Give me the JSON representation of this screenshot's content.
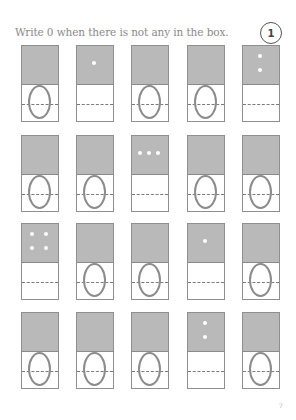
{
  "instruction": "Write 0 when there is not any in the box.",
  "exercise_number": "1",
  "page_number": "7",
  "colors": {
    "card_top": "#b9b9b9",
    "card_border": "#8f8f8f",
    "oval": "#8c8c8c",
    "dot": "#ffffff",
    "text": "#8a8a8a"
  },
  "layout": {
    "columns_x": [
      21,
      76,
      131,
      187,
      242
    ],
    "rows_y": [
      45,
      135,
      223,
      312
    ]
  },
  "cards": [
    [
      {
        "dots": 0,
        "answer": "0"
      },
      {
        "dots": 1,
        "answer": ""
      },
      {
        "dots": 0,
        "answer": "0"
      },
      {
        "dots": 0,
        "answer": "0"
      },
      {
        "dots": 2,
        "answer": ""
      }
    ],
    [
      {
        "dots": 0,
        "answer": "0"
      },
      {
        "dots": 0,
        "answer": "0"
      },
      {
        "dots": 3,
        "answer": ""
      },
      {
        "dots": 0,
        "answer": "0"
      },
      {
        "dots": 0,
        "answer": "0"
      }
    ],
    [
      {
        "dots": 4,
        "answer": ""
      },
      {
        "dots": 0,
        "answer": "0"
      },
      {
        "dots": 0,
        "answer": "0"
      },
      {
        "dots": 1,
        "answer": ""
      },
      {
        "dots": 0,
        "answer": "0"
      }
    ],
    [
      {
        "dots": 0,
        "answer": "0"
      },
      {
        "dots": 0,
        "answer": "0"
      },
      {
        "dots": 0,
        "answer": "0"
      },
      {
        "dots": 2,
        "answer": ""
      },
      {
        "dots": 0,
        "answer": "0"
      }
    ]
  ]
}
